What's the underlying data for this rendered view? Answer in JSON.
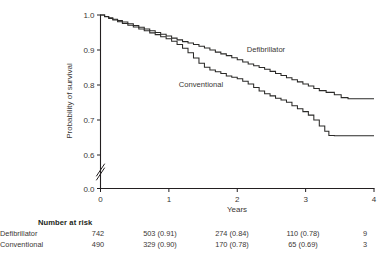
{
  "chart_data": {
    "type": "line",
    "title": "",
    "xlabel": "Years",
    "ylabel": "Probability of survival",
    "xlim": [
      0,
      4
    ],
    "ylim": [
      0.55,
      1.0
    ],
    "xticks": [
      "0",
      "1",
      "2",
      "3",
      "4"
    ],
    "xtick_values": [
      0,
      1,
      2,
      3,
      4
    ],
    "yticks": [
      "0.0",
      "0.6",
      "0.7",
      "0.8",
      "0.9",
      "1.0"
    ],
    "ytick_values": [
      0.0,
      0.6,
      0.7,
      0.8,
      0.9,
      1.0
    ],
    "axis_break": true,
    "axis_break_between": [
      0.0,
      0.6
    ],
    "grid": false,
    "legend_position": "inline-annotation",
    "line_color": "#2b2a28",
    "series": [
      {
        "name": "Defibrillator",
        "label_x": 2.42,
        "label_y": 0.893,
        "points": [
          [
            0.0,
            1.0
          ],
          [
            0.06,
            0.996
          ],
          [
            0.12,
            0.992
          ],
          [
            0.18,
            0.988
          ],
          [
            0.25,
            0.984
          ],
          [
            0.32,
            0.98
          ],
          [
            0.4,
            0.975
          ],
          [
            0.48,
            0.97
          ],
          [
            0.56,
            0.965
          ],
          [
            0.64,
            0.96
          ],
          [
            0.72,
            0.955
          ],
          [
            0.8,
            0.95
          ],
          [
            0.88,
            0.945
          ],
          [
            0.96,
            0.94
          ],
          [
            1.04,
            0.934
          ],
          [
            1.12,
            0.929
          ],
          [
            1.2,
            0.924
          ],
          [
            1.28,
            0.92
          ],
          [
            1.36,
            0.916
          ],
          [
            1.44,
            0.911
          ],
          [
            1.52,
            0.906
          ],
          [
            1.6,
            0.9
          ],
          [
            1.68,
            0.894
          ],
          [
            1.76,
            0.889
          ],
          [
            1.84,
            0.884
          ],
          [
            1.92,
            0.878
          ],
          [
            2.0,
            0.872
          ],
          [
            2.08,
            0.866
          ],
          [
            2.16,
            0.86
          ],
          [
            2.24,
            0.855
          ],
          [
            2.32,
            0.85
          ],
          [
            2.4,
            0.845
          ],
          [
            2.48,
            0.839
          ],
          [
            2.56,
            0.833
          ],
          [
            2.64,
            0.827
          ],
          [
            2.72,
            0.821
          ],
          [
            2.8,
            0.815
          ],
          [
            2.88,
            0.809
          ],
          [
            2.96,
            0.803
          ],
          [
            3.04,
            0.797
          ],
          [
            3.12,
            0.79
          ],
          [
            3.2,
            0.784
          ],
          [
            3.3,
            0.779
          ],
          [
            3.42,
            0.772
          ],
          [
            3.52,
            0.764
          ],
          [
            3.62,
            0.761
          ],
          [
            4.0,
            0.761
          ]
        ]
      },
      {
        "name": "Conventional",
        "label_x": 1.47,
        "label_y": 0.795,
        "points": [
          [
            0.0,
            1.0
          ],
          [
            0.06,
            0.995
          ],
          [
            0.12,
            0.99
          ],
          [
            0.18,
            0.986
          ],
          [
            0.25,
            0.981
          ],
          [
            0.32,
            0.976
          ],
          [
            0.4,
            0.971
          ],
          [
            0.48,
            0.966
          ],
          [
            0.56,
            0.96
          ],
          [
            0.64,
            0.955
          ],
          [
            0.72,
            0.949
          ],
          [
            0.8,
            0.944
          ],
          [
            0.88,
            0.938
          ],
          [
            0.96,
            0.932
          ],
          [
            1.04,
            0.925
          ],
          [
            1.12,
            0.916
          ],
          [
            1.2,
            0.905
          ],
          [
            1.28,
            0.892
          ],
          [
            1.36,
            0.877
          ],
          [
            1.44,
            0.862
          ],
          [
            1.52,
            0.851
          ],
          [
            1.6,
            0.843
          ],
          [
            1.68,
            0.838
          ],
          [
            1.76,
            0.833
          ],
          [
            1.84,
            0.826
          ],
          [
            1.92,
            0.822
          ],
          [
            2.0,
            0.818
          ],
          [
            2.08,
            0.811
          ],
          [
            2.16,
            0.803
          ],
          [
            2.24,
            0.793
          ],
          [
            2.32,
            0.783
          ],
          [
            2.4,
            0.775
          ],
          [
            2.48,
            0.769
          ],
          [
            2.56,
            0.762
          ],
          [
            2.64,
            0.757
          ],
          [
            2.72,
            0.751
          ],
          [
            2.8,
            0.741
          ],
          [
            2.88,
            0.732
          ],
          [
            2.96,
            0.724
          ],
          [
            3.04,
            0.714
          ],
          [
            3.12,
            0.7
          ],
          [
            3.2,
            0.683
          ],
          [
            3.28,
            0.668
          ],
          [
            3.34,
            0.656
          ],
          [
            3.42,
            0.655
          ],
          [
            4.0,
            0.655
          ]
        ]
      }
    ]
  },
  "risk_table": {
    "heading": "Number at risk",
    "rows": [
      {
        "label": "Defibrillator",
        "values": [
          "742",
          "503 (0.91)",
          "274 (0.84)",
          "110 (0.78)",
          "9"
        ]
      },
      {
        "label": "Conventional",
        "values": [
          "490",
          "329 (0.90)",
          "170 (0.78)",
          "65 (0.69)",
          "3"
        ]
      }
    ]
  }
}
